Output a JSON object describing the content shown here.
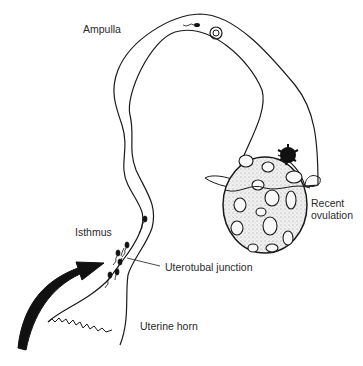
{
  "diagram": {
    "labels": {
      "ampulla": "Ampulla",
      "isthmus": "Isthmus",
      "uterotubal_junction": "Uterotubal junction",
      "uterine_horn": "Uterine horn",
      "recent_ovulation_line1": "Recent",
      "recent_ovulation_line2": "ovulation"
    },
    "colors": {
      "line": "#1a1a1a",
      "text": "#2a2a2a",
      "ovary_fill": "#e4e4e4",
      "background": "#ffffff"
    }
  }
}
